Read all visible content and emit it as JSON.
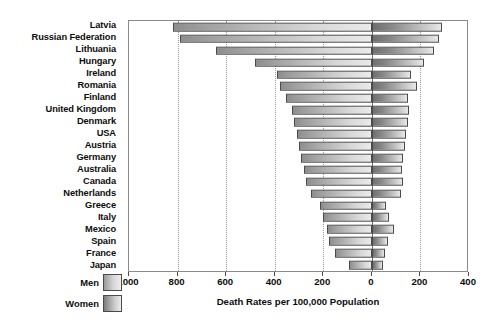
{
  "chart_data": {
    "type": "bar",
    "orientation": "horizontal-diverging",
    "title": "",
    "xlabel": "Death Rates per 100,000 Population",
    "ylabel": "",
    "grid": true,
    "legend_position": "bottom-left",
    "axis": {
      "left_max": 1000,
      "right_max": 400,
      "tick_values": [
        1000,
        800,
        600,
        400,
        200,
        0,
        200,
        400
      ],
      "tick_labels": [
        "1000",
        "800",
        "600",
        "400",
        "200",
        "0",
        "200",
        "400"
      ]
    },
    "categories": [
      "Latvia",
      "Russian Federation",
      "Lithuania",
      "Hungary",
      "Ireland",
      "Romania",
      "Finland",
      "United Kingdom",
      "Denmark",
      "USA",
      "Austria",
      "Germany",
      "Australia",
      "Canada",
      "Netherlands",
      "Greece",
      "Italy",
      "Mexico",
      "Spain",
      "France",
      "Japan"
    ],
    "series": [
      {
        "name": "Men",
        "side": "left",
        "color": "#9c9c9c",
        "values": [
          820,
          790,
          640,
          480,
          390,
          380,
          355,
          330,
          320,
          310,
          300,
          290,
          280,
          270,
          250,
          215,
          200,
          185,
          175,
          150,
          95
        ]
      },
      {
        "name": "Women",
        "side": "right",
        "color": "#858585",
        "values": [
          290,
          275,
          255,
          215,
          160,
          185,
          150,
          155,
          150,
          140,
          135,
          130,
          125,
          130,
          120,
          60,
          70,
          90,
          65,
          55,
          45
        ]
      }
    ]
  },
  "legend": {
    "items": [
      {
        "label": "Men",
        "swatch": "men-swatch"
      },
      {
        "label": "Women",
        "swatch": "women-swatch"
      }
    ]
  }
}
